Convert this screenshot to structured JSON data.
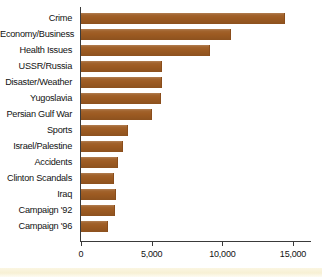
{
  "chart_data": {
    "type": "bar",
    "orientation": "horizontal",
    "title": "",
    "xlabel": "",
    "ylabel": "",
    "categories": [
      "Crime",
      "Economy/Business",
      "Health Issues",
      "USSR/Russia",
      "Disaster/Weather",
      "Yugoslavia",
      "Persian Gulf War",
      "Sports",
      "Israel/Palestine",
      "Accidents",
      "Clinton Scandals",
      "Iraq",
      "Campaign '92",
      "Campaign '96"
    ],
    "values": [
      14450,
      10600,
      9100,
      5750,
      5750,
      5650,
      5000,
      3300,
      3000,
      2650,
      2300,
      2450,
      2400,
      1900
    ],
    "xlim": [
      0,
      16200
    ],
    "xticks": [
      0,
      5000,
      10000,
      15000
    ],
    "xticklabels": [
      "0",
      "5,000",
      "10,000",
      "15,000"
    ],
    "grid": false,
    "legend": null,
    "bar_color": "#9d5b22",
    "axis_color": "#3a3a3a",
    "background_color": "#ffffff"
  }
}
